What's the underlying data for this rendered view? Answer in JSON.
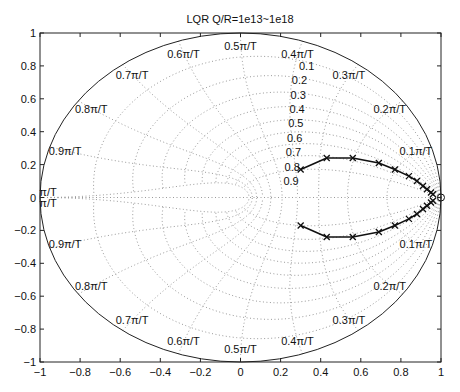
{
  "chart_data": {
    "type": "scatter",
    "title": "LQR Q/R=1e13~1e18",
    "xlabel": "",
    "ylabel": "",
    "xlim": [
      -1,
      1
    ],
    "ylim": [
      -1,
      1
    ],
    "xticks": [
      "-1",
      "-0.8",
      "-0.6",
      "-0.4",
      "-0.2",
      "0",
      "0.2",
      "0.4",
      "0.6",
      "0.8",
      "1"
    ],
    "yticks": [
      "-1",
      "-0.8",
      "-0.6",
      "-0.4",
      "-0.2",
      "0",
      "0.2",
      "0.4",
      "0.6",
      "0.8",
      "1"
    ],
    "grid": "zgrid (z-plane damping / natural frequency)",
    "damping_labels": [
      "0.1",
      "0.2",
      "0.3",
      "0.4",
      "0.5",
      "0.6",
      "0.7",
      "0.8",
      "0.9"
    ],
    "frequency_labels_upper": [
      "0.1π/T",
      "0.2π/T",
      "0.3π/T",
      "0.4π/T",
      "0.5π/T",
      "0.6π/T",
      "0.7π/T",
      "0.8π/T",
      "0.9π/T",
      "π/T"
    ],
    "frequency_labels_lower": [
      "0.1π/T",
      "0.2π/T",
      "0.3π/T",
      "0.4π/T",
      "0.5π/T",
      "0.6π/T",
      "0.7π/T",
      "0.8π/T",
      "0.9π/T",
      "π/T"
    ],
    "series": [
      {
        "name": "closed-loop poles (upper)",
        "marker": "x",
        "x": [
          0.3,
          0.43,
          0.56,
          0.69,
          0.77,
          0.84,
          0.88,
          0.91,
          0.93,
          0.95,
          0.96
        ],
        "y": [
          0.17,
          0.24,
          0.24,
          0.21,
          0.17,
          0.13,
          0.1,
          0.07,
          0.05,
          0.03,
          0.02
        ]
      },
      {
        "name": "closed-loop poles (lower)",
        "marker": "x",
        "x": [
          0.3,
          0.43,
          0.56,
          0.69,
          0.77,
          0.84,
          0.88,
          0.91,
          0.93,
          0.95,
          0.96
        ],
        "y": [
          -0.17,
          -0.24,
          -0.24,
          -0.21,
          -0.17,
          -0.13,
          -0.1,
          -0.07,
          -0.05,
          -0.03,
          -0.02
        ]
      }
    ],
    "open_loop_marker": {
      "x": 1.0,
      "y": 0.0,
      "marker": "o"
    }
  },
  "colors": {
    "axes": "#222222",
    "grid": "#9a9a9a",
    "curve": "#111111"
  }
}
